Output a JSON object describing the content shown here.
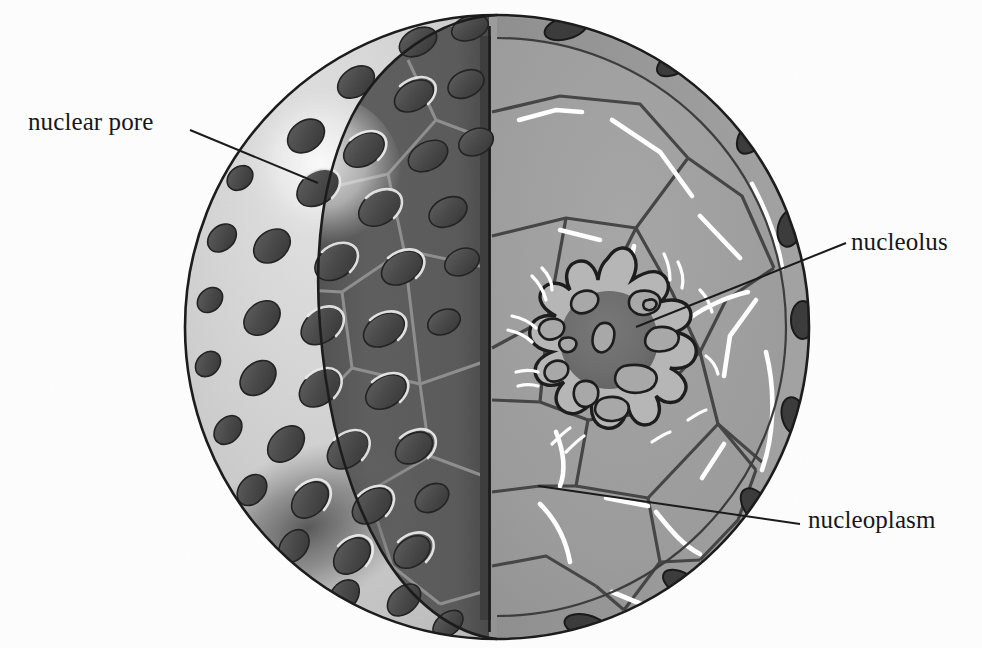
{
  "figure": {
    "background_color": "#fdfdfd",
    "labels": [
      {
        "id": "nuclear-pore",
        "text": "nuclear pore",
        "x": 28,
        "y": 108,
        "leader_from": [
          190,
          130
        ],
        "leader_to": [
          318,
          183
        ]
      },
      {
        "id": "nucleolus",
        "text": "nucleolus",
        "x": 851,
        "y": 228,
        "leader_from": [
          846,
          243
        ],
        "leader_to": [
          636,
          327
        ]
      },
      {
        "id": "nucleoplasm",
        "text": "nucleoplasm",
        "x": 808,
        "y": 506,
        "leader_from": [
          800,
          524
        ],
        "leader_to": [
          538,
          486
        ]
      }
    ]
  },
  "colors": {
    "outline": "#1b1b1b",
    "background": "#fdfdfd",
    "outer_surface": "#c9c9c9",
    "outer_surface_light": "#dcdcdc",
    "cut_face_dark": "#5b5b5b",
    "cut_face_line": "#8e8e8e",
    "cut_strip": "#3f3f3f",
    "nucleoplasm_fill": "#9a9a9a",
    "nucleoplasm_rim": "#8a8a8a",
    "polygon_line": "#4a4a4a",
    "highlight_white": "#ffffff",
    "pore_dark": "#4b4b4b",
    "pore_darker": "#3a3a3a",
    "pore_rim": "#e6e6e6",
    "nucleolus_body": "#b4b4b4",
    "nucleolus_core": "#6f6f6f",
    "leader_line": "#1b1b1b",
    "shadow": "#6a6a6a"
  },
  "geometry": {
    "sphere_center": [
      497,
      327
    ],
    "sphere_rx": 312,
    "sphere_ry": 312,
    "cut_plane_x": 489,
    "nucleolus_center": [
      608,
      340
    ],
    "nucleolus_core_r": 48,
    "nucleolus_lobe_count": 13,
    "nuclear_pore_count": 47,
    "highlight_sphere_center": [
      320,
      175
    ],
    "highlight_sphere_r": 78
  },
  "structures": [
    {
      "name": "nuclear-envelope",
      "description": "outer spherical membrane with pores"
    },
    {
      "name": "nuclear-pore",
      "description": "elliptical channel through envelope"
    },
    {
      "name": "nucleoplasm",
      "description": "interior granular matrix with polygonal domains"
    },
    {
      "name": "nucleolus",
      "description": "lobed dense body with dark core"
    }
  ]
}
